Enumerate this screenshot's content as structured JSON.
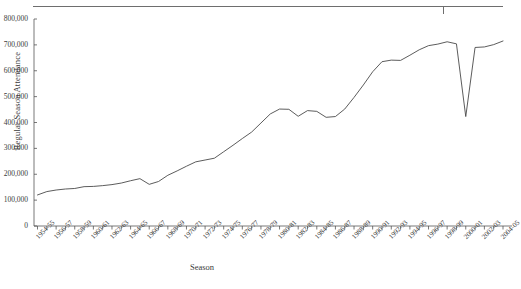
{
  "chart_data": {
    "type": "line",
    "title": "",
    "xlabel": "Season",
    "ylabel": "Regular Season Attendance",
    "ylim": [
      0,
      800000
    ],
    "ytick_labels": [
      "800,000",
      "700,000",
      "600,000",
      "500,000",
      "400,000",
      "300,000",
      "200,000",
      "100,000",
      "0"
    ],
    "ytick_values": [
      800000,
      700000,
      600000,
      500000,
      400000,
      300000,
      200000,
      100000,
      0
    ],
    "grid": false,
    "legend": false,
    "line_color": "#4a4a4a",
    "xtick_labels": [
      "1954-55",
      "1956-57",
      "1958-59",
      "1960-61",
      "1962-63",
      "1964-65",
      "1966-67",
      "1968-69",
      "1970-71",
      "1972-73",
      "1974-75",
      "1976-77",
      "1978-79",
      "1980-81",
      "1982-83",
      "1984-85",
      "1986-87",
      "1988-89",
      "1990-91",
      "1992-93",
      "1994-95",
      "1996-97",
      "1998-99",
      "2000-01",
      "2002-03",
      "2004-05"
    ],
    "categories": [
      "1954-55",
      "1955-56",
      "1956-57",
      "1957-58",
      "1958-59",
      "1959-60",
      "1960-61",
      "1961-62",
      "1962-63",
      "1963-64",
      "1964-65",
      "1965-66",
      "1966-67",
      "1967-68",
      "1968-69",
      "1969-70",
      "1970-71",
      "1971-72",
      "1972-73",
      "1973-74",
      "1974-75",
      "1975-76",
      "1976-77",
      "1977-78",
      "1978-79",
      "1979-80",
      "1980-81",
      "1981-82",
      "1982-83",
      "1983-84",
      "1984-85",
      "1985-86",
      "1986-87",
      "1987-88",
      "1988-89",
      "1989-90",
      "1990-91",
      "1991-92",
      "1992-93",
      "1993-94",
      "1994-95",
      "1995-96",
      "1996-97",
      "1997-98",
      "1998-99",
      "1999-00",
      "2000-01",
      "2001-02",
      "2002-03",
      "2003-04",
      "2004-05"
    ],
    "values": [
      120000,
      133000,
      139000,
      143000,
      145000,
      152000,
      153000,
      156000,
      160000,
      166000,
      175000,
      183000,
      161000,
      172000,
      196000,
      213000,
      231000,
      248000,
      255000,
      262000,
      287000,
      312000,
      338000,
      363000,
      398000,
      433000,
      452000,
      451000,
      424000,
      446000,
      443000,
      420000,
      423000,
      452000,
      497000,
      545000,
      596000,
      635000,
      641000,
      640000,
      660000,
      681000,
      697000,
      703000,
      712000,
      704000,
      423000,
      690000,
      692000,
      701000,
      715000
    ]
  }
}
